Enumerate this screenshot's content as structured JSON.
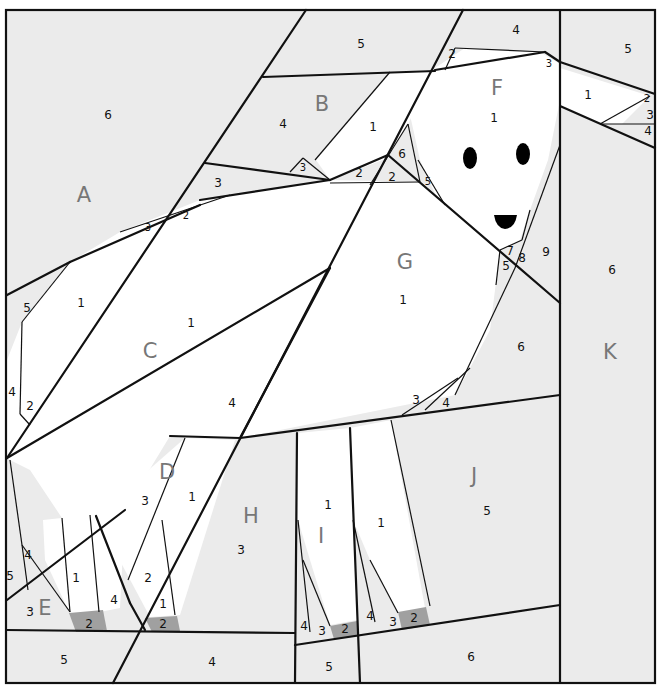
{
  "diagram": {
    "type": "foundation paper piecing pattern",
    "colors": {
      "background_fabric": "#ebebeb",
      "dog_fabric": "#ffffff",
      "paw_fabric": "#a0a0a0",
      "features": "#000000",
      "lines": "#111111",
      "section_letters": "#777777"
    }
  },
  "sections": [
    {
      "letter": "A",
      "x": 84,
      "y": 195,
      "pieces": [
        {
          "n": "6",
          "x": 108,
          "y": 115
        },
        {
          "n": "5",
          "x": 27,
          "y": 308
        },
        {
          "n": "4",
          "x": 12,
          "y": 392
        },
        {
          "n": "3",
          "x": 148,
          "y": 228,
          "small": true
        },
        {
          "n": "2",
          "x": 186,
          "y": 216,
          "small": true
        },
        {
          "n": "2",
          "x": 30,
          "y": 406
        }
      ]
    },
    {
      "letter": "B",
      "x": 322,
      "y": 104,
      "pieces": [
        {
          "n": "5",
          "x": 361,
          "y": 44
        },
        {
          "n": "4",
          "x": 283,
          "y": 124
        },
        {
          "n": "1",
          "x": 373,
          "y": 127
        },
        {
          "n": "3",
          "x": 303,
          "y": 168,
          "small": true
        },
        {
          "n": "2",
          "x": 359,
          "y": 173
        },
        {
          "n": "6",
          "x": 402,
          "y": 154
        },
        {
          "n": "2",
          "x": 392,
          "y": 177
        },
        {
          "n": "3",
          "x": 218,
          "y": 183
        },
        {
          "n": "5",
          "x": 428,
          "y": 182,
          "small": true
        }
      ]
    },
    {
      "letter": "C",
      "x": 150,
      "y": 351,
      "pieces": [
        {
          "n": "1",
          "x": 81,
          "y": 303
        },
        {
          "n": "1",
          "x": 191,
          "y": 323
        },
        {
          "n": "4",
          "x": 232,
          "y": 403
        }
      ]
    },
    {
      "letter": "D",
      "x": 167,
      "y": 472,
      "pieces": [
        {
          "n": "3",
          "x": 145,
          "y": 501
        },
        {
          "n": "1",
          "x": 192,
          "y": 497
        },
        {
          "n": "2",
          "x": 148,
          "y": 578
        },
        {
          "n": "1",
          "x": 163,
          "y": 604
        },
        {
          "n": "4",
          "x": 114,
          "y": 600
        },
        {
          "n": "2",
          "x": 163,
          "y": 624,
          "dark": true
        }
      ]
    },
    {
      "letter": "E",
      "x": 45,
      "y": 608,
      "pieces": [
        {
          "n": "4",
          "x": 28,
          "y": 555
        },
        {
          "n": "5",
          "x": 10,
          "y": 576
        },
        {
          "n": "3",
          "x": 30,
          "y": 612
        },
        {
          "n": "1",
          "x": 76,
          "y": 578
        },
        {
          "n": "2",
          "x": 89,
          "y": 624,
          "dark": true
        },
        {
          "n": "5",
          "x": 64,
          "y": 660
        },
        {
          "n": "4",
          "x": 212,
          "y": 662
        }
      ]
    },
    {
      "letter": "F",
      "x": 497,
      "y": 88,
      "pieces": [
        {
          "n": "4",
          "x": 516,
          "y": 30
        },
        {
          "n": "2",
          "x": 452,
          "y": 54
        },
        {
          "n": "3",
          "x": 549,
          "y": 64,
          "small": true
        },
        {
          "n": "1",
          "x": 494,
          "y": 118
        },
        {
          "n": "5",
          "x": 628,
          "y": 49
        },
        {
          "n": "1",
          "x": 588,
          "y": 95
        },
        {
          "n": "2",
          "x": 647,
          "y": 99,
          "small": true
        },
        {
          "n": "3",
          "x": 650,
          "y": 115
        },
        {
          "n": "4",
          "x": 648,
          "y": 131
        }
      ]
    },
    {
      "letter": "G",
      "x": 405,
      "y": 262,
      "pieces": [
        {
          "n": "1",
          "x": 403,
          "y": 300
        },
        {
          "n": "7",
          "x": 510,
          "y": 251
        },
        {
          "n": "8",
          "x": 522,
          "y": 258
        },
        {
          "n": "5",
          "x": 506,
          "y": 266
        },
        {
          "n": "9",
          "x": 546,
          "y": 252
        },
        {
          "n": "6",
          "x": 521,
          "y": 347
        },
        {
          "n": "3",
          "x": 416,
          "y": 400
        },
        {
          "n": "4",
          "x": 446,
          "y": 403
        }
      ]
    },
    {
      "letter": "H",
      "x": 251,
      "y": 516,
      "pieces": [
        {
          "n": "3",
          "x": 241,
          "y": 550
        }
      ]
    },
    {
      "letter": "I",
      "x": 321,
      "y": 536,
      "pieces": [
        {
          "n": "1",
          "x": 328,
          "y": 505
        },
        {
          "n": "1",
          "x": 381,
          "y": 523
        },
        {
          "n": "4",
          "x": 304,
          "y": 626
        },
        {
          "n": "3",
          "x": 322,
          "y": 631
        },
        {
          "n": "2",
          "x": 345,
          "y": 629,
          "dark": true
        },
        {
          "n": "4",
          "x": 370,
          "y": 616
        },
        {
          "n": "3",
          "x": 393,
          "y": 622
        },
        {
          "n": "2",
          "x": 414,
          "y": 618,
          "dark": true
        },
        {
          "n": "5",
          "x": 329,
          "y": 667
        }
      ]
    },
    {
      "letter": "J",
      "x": 474,
      "y": 476,
      "pieces": [
        {
          "n": "5",
          "x": 487,
          "y": 511
        },
        {
          "n": "6",
          "x": 471,
          "y": 657
        }
      ]
    },
    {
      "letter": "K",
      "x": 610,
      "y": 352,
      "pieces": [
        {
          "n": "6",
          "x": 612,
          "y": 270
        }
      ]
    }
  ]
}
